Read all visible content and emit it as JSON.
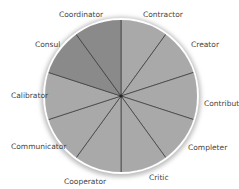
{
  "diagram": {
    "type": "wheel",
    "center": [
      121,
      96
    ],
    "radius": 78,
    "colors": {
      "light": "#a9a9a9",
      "dark": "#8a8a8a",
      "spoke": "#3a3a3a",
      "rim": "#ffffff"
    },
    "segments": [
      {
        "label": "Contractor",
        "shade": "light"
      },
      {
        "label": "Creator",
        "shade": "light"
      },
      {
        "label": "Contributor",
        "shade": "light"
      },
      {
        "label": "Completer",
        "shade": "light"
      },
      {
        "label": "Critic",
        "shade": "light"
      },
      {
        "label": "Cooperator",
        "shade": "light"
      },
      {
        "label": "Communicator",
        "shade": "light"
      },
      {
        "label": "Calibrator",
        "shade": "light"
      },
      {
        "label": "Consul",
        "shade": "dark"
      },
      {
        "label": "Coordinator",
        "shade": "dark"
      }
    ]
  }
}
